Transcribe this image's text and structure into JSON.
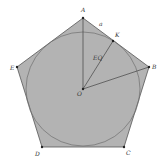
{
  "diagram": {
    "colors": {
      "fill": "#b3b3b3",
      "stroke": "#555555",
      "circle": "#6e6e6e",
      "point": "#222222",
      "background": "#ffffff"
    },
    "points": {
      "A": {
        "label": "A",
        "x": 83,
        "y": 18
      },
      "B": {
        "label": "B",
        "x": 149,
        "y": 67
      },
      "C": {
        "label": "C",
        "x": 124,
        "y": 147
      },
      "D": {
        "label": "D",
        "x": 42,
        "y": 147
      },
      "E": {
        "label": "E",
        "x": 17,
        "y": 67
      },
      "O": {
        "label": "O",
        "x": 83,
        "y": 89
      },
      "K": {
        "label": "K",
        "x": 113,
        "y": 41
      }
    },
    "circle": {
      "cx": 83,
      "cy": 89,
      "r": 57
    },
    "segment_labels": {
      "side_label": "a",
      "radius_label": "EQ"
    }
  }
}
